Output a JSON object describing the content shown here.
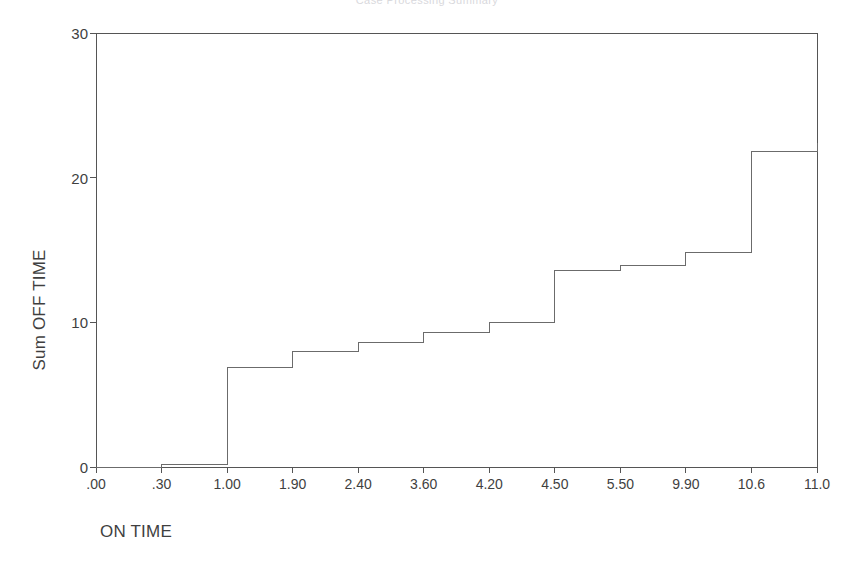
{
  "figure": {
    "cut_off_title": "Case Processing Summary",
    "background_color": "#ffffff",
    "line_color": "#6b6b6b",
    "axis_color": "#555555",
    "text_color": "#3f3f3f"
  },
  "chart_data": {
    "type": "line",
    "subtype": "step",
    "title": "",
    "xlabel": "ON TIME",
    "ylabel": "Sum OFF TIME",
    "grid": false,
    "legend": null,
    "categories": [
      ".00",
      ".30",
      "1.00",
      "1.90",
      "2.40",
      "3.60",
      "4.20",
      "4.50",
      "5.50",
      "9.90",
      "10.6",
      "11.0"
    ],
    "x_tick_labels": [
      ".00",
      ".30",
      "1.00",
      "1.90",
      "2.40",
      "3.60",
      "4.20",
      "4.50",
      "5.50",
      "9.90",
      "10.6",
      "11.0"
    ],
    "y_tick_labels": [
      "0",
      "10",
      "20",
      "30"
    ],
    "y_ticks": [
      0,
      10,
      20,
      30
    ],
    "ylim": [
      0,
      30
    ],
    "xlim_categories": [
      0,
      11
    ],
    "values": [
      0,
      0.2,
      6.9,
      8.0,
      8.6,
      9.3,
      10.0,
      13.6,
      13.9,
      14.8,
      21.8,
      22.4
    ],
    "series": [
      {
        "name": "Sum OFF TIME",
        "values": [
          0,
          0.2,
          6.9,
          8.0,
          8.6,
          9.3,
          10.0,
          13.6,
          13.9,
          14.8,
          21.8,
          22.4
        ]
      }
    ],
    "points": [
      {
        "x": ".00",
        "y": 0
      },
      {
        "x": ".30",
        "y": 0.2
      },
      {
        "x": "1.00",
        "y": 6.9
      },
      {
        "x": "1.90",
        "y": 8.0
      },
      {
        "x": "2.40",
        "y": 8.6
      },
      {
        "x": "3.60",
        "y": 9.3
      },
      {
        "x": "4.20",
        "y": 10.0
      },
      {
        "x": "4.50",
        "y": 13.6
      },
      {
        "x": "5.50",
        "y": 13.9
      },
      {
        "x": "9.90",
        "y": 14.8
      },
      {
        "x": "10.6",
        "y": 21.8
      },
      {
        "x": "11.0",
        "y": 22.4
      }
    ]
  }
}
